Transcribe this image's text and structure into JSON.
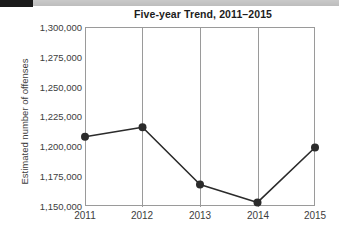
{
  "chart_data": {
    "type": "line",
    "title": "Five-year Trend, 2011–2015",
    "xlabel": "",
    "ylabel": "Estimated number of offenses",
    "categories": [
      "2011",
      "2012",
      "2013",
      "2014",
      "2015"
    ],
    "values": [
      1208000,
      1216000,
      1168000,
      1153000,
      1199000
    ],
    "ylim": [
      1150000,
      1300000
    ],
    "ytick_values": [
      1300000,
      1275000,
      1250000,
      1225000,
      1200000,
      1175000,
      1150000
    ],
    "ytick_labels": [
      "1,300,000",
      "1,275,000",
      "1,250,000",
      "1,225,000",
      "1,200,000",
      "1,175,000",
      "1,150,000"
    ],
    "grid": "vertical",
    "legend": "none",
    "series": [
      {
        "name": "Estimated number of offenses",
        "values": [
          1208000,
          1216000,
          1168000,
          1153000,
          1199000
        ]
      }
    ],
    "line_color": "#2b2b2b",
    "marker_color": "#2b2b2b",
    "frame_color": "#9a9a9a"
  },
  "artifact": {
    "bottom_text": ""
  }
}
